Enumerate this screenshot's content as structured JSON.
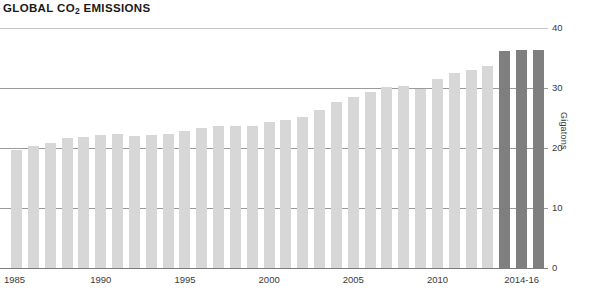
{
  "title": {
    "main": "GLOBAL CO",
    "subscript": "2",
    "tail": " EMISSIONS",
    "full": "GLOBAL CO2 EMISSIONS"
  },
  "colors": {
    "bar_light": "#d7d7d7",
    "bar_dark": "#7f7f7f",
    "gridline": "#9a9a9a",
    "text": "#231f20"
  },
  "chart_data": {
    "type": "bar",
    "title": "GLOBAL CO2 EMISSIONS",
    "xlabel": "",
    "ylabel": "Gigatons",
    "ylim": [
      0,
      40
    ],
    "yticks": [
      0,
      10,
      20,
      30,
      40
    ],
    "ytick_labels": [
      "0",
      "10",
      "20",
      "30",
      "40"
    ],
    "xtick_labels": [
      "1985",
      "1990",
      "1995",
      "2000",
      "2005",
      "2010",
      "2014-16"
    ],
    "xtick_indices": [
      0,
      5,
      10,
      15,
      20,
      25,
      30
    ],
    "grid": true,
    "legend": false,
    "highlight_note": "last three bars (2014, 2015, 2016) shown in dark gray",
    "categories": [
      "1985",
      "1986",
      "1987",
      "1988",
      "1989",
      "1990",
      "1991",
      "1992",
      "1993",
      "1994",
      "1995",
      "1996",
      "1997",
      "1998",
      "1999",
      "2000",
      "2001",
      "2002",
      "2003",
      "2004",
      "2005",
      "2006",
      "2007",
      "2008",
      "2009",
      "2010",
      "2011",
      "2012",
      "2013",
      "2014",
      "2015",
      "2016"
    ],
    "values": [
      19.7,
      20.4,
      20.9,
      21.6,
      21.9,
      22.2,
      22.3,
      22.0,
      22.1,
      22.3,
      22.8,
      23.4,
      23.6,
      23.6,
      23.7,
      24.4,
      24.7,
      25.1,
      26.3,
      27.6,
      28.5,
      29.4,
      30.2,
      30.3,
      29.9,
      31.5,
      32.5,
      33.0,
      33.6,
      36.2,
      36.3,
      36.3
    ],
    "colors": [
      "light",
      "light",
      "light",
      "light",
      "light",
      "light",
      "light",
      "light",
      "light",
      "light",
      "light",
      "light",
      "light",
      "light",
      "light",
      "light",
      "light",
      "light",
      "light",
      "light",
      "light",
      "light",
      "light",
      "light",
      "light",
      "light",
      "light",
      "light",
      "light",
      "dark",
      "dark",
      "dark"
    ]
  }
}
